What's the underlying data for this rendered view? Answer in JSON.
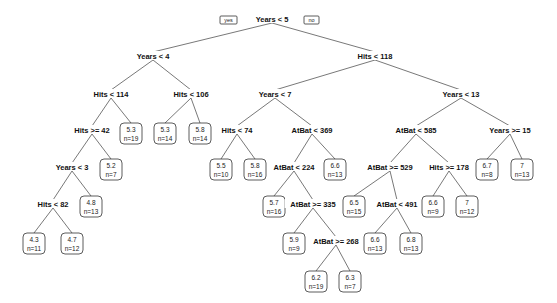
{
  "diagram": {
    "type": "regression-tree",
    "branch_labels": {
      "yes": "yes",
      "no": "no"
    },
    "nodes": [
      {
        "id": "n1",
        "kind": "split",
        "label": "Years < 5",
        "x": 272,
        "y": 20,
        "parent": null
      },
      {
        "id": "n2",
        "kind": "split",
        "label": "Years < 4",
        "x": 153,
        "y": 57,
        "parent": "n1"
      },
      {
        "id": "n3",
        "kind": "split",
        "label": "Hits < 118",
        "x": 375,
        "y": 57,
        "parent": "n1"
      },
      {
        "id": "n4",
        "kind": "split",
        "label": "Hits < 114",
        "x": 111,
        "y": 95,
        "parent": "n2"
      },
      {
        "id": "n5",
        "kind": "split",
        "label": "Hits < 106",
        "x": 191,
        "y": 95,
        "parent": "n2"
      },
      {
        "id": "n8",
        "kind": "split",
        "label": "Hits >= 42",
        "x": 92,
        "y": 131,
        "parent": "n4"
      },
      {
        "id": "n9",
        "kind": "leaf",
        "value": "5.3",
        "n": "n=19",
        "x": 131,
        "y": 133,
        "parent": "n4"
      },
      {
        "id": "n10",
        "kind": "leaf",
        "value": "5.3",
        "n": "n=14",
        "x": 165,
        "y": 133,
        "parent": "n5"
      },
      {
        "id": "n11",
        "kind": "leaf",
        "value": "5.8",
        "n": "n=14",
        "x": 200,
        "y": 133,
        "parent": "n5"
      },
      {
        "id": "n16",
        "kind": "split",
        "label": "Years < 3",
        "x": 72,
        "y": 168,
        "parent": "n8"
      },
      {
        "id": "n17",
        "kind": "leaf",
        "value": "5.2",
        "n": "n=7",
        "x": 111,
        "y": 169,
        "parent": "n8"
      },
      {
        "id": "n32",
        "kind": "split",
        "label": "Hits < 82",
        "x": 53,
        "y": 205,
        "parent": "n16"
      },
      {
        "id": "n33",
        "kind": "leaf",
        "value": "4.8",
        "n": "n=13",
        "x": 91,
        "y": 206,
        "parent": "n16"
      },
      {
        "id": "n64",
        "kind": "leaf",
        "value": "4.3",
        "n": "n=11",
        "x": 34,
        "y": 243,
        "parent": "n32"
      },
      {
        "id": "n65",
        "kind": "leaf",
        "value": "4.7",
        "n": "n=12",
        "x": 72,
        "y": 243,
        "parent": "n32"
      },
      {
        "id": "n6",
        "kind": "split",
        "label": "Years < 7",
        "x": 275,
        "y": 95,
        "parent": "n3"
      },
      {
        "id": "n7",
        "kind": "split",
        "label": "Years < 13",
        "x": 461,
        "y": 95,
        "parent": "n3"
      },
      {
        "id": "n12",
        "kind": "split",
        "label": "Hits < 74",
        "x": 237,
        "y": 131,
        "parent": "n6"
      },
      {
        "id": "n13",
        "kind": "split",
        "label": "AtBat < 369",
        "x": 312,
        "y": 131,
        "parent": "n6"
      },
      {
        "id": "n24",
        "kind": "leaf",
        "value": "5.5",
        "n": "n=10",
        "x": 221,
        "y": 169,
        "parent": "n12"
      },
      {
        "id": "n25",
        "kind": "leaf",
        "value": "5.8",
        "n": "n=16",
        "x": 255,
        "y": 169,
        "parent": "n12"
      },
      {
        "id": "n26",
        "kind": "split",
        "label": "AtBat < 224",
        "x": 294,
        "y": 168,
        "parent": "n13"
      },
      {
        "id": "n27",
        "kind": "leaf",
        "value": "6.6",
        "n": "n=13",
        "x": 335,
        "y": 169,
        "parent": "n13"
      },
      {
        "id": "n52",
        "kind": "leaf",
        "value": "5.7",
        "n": "n=16",
        "x": 274,
        "y": 206,
        "parent": "n26"
      },
      {
        "id": "n53",
        "kind": "split",
        "label": "AtBat >= 335",
        "x": 313,
        "y": 205,
        "parent": "n26"
      },
      {
        "id": "n106",
        "kind": "leaf",
        "value": "5.9",
        "n": "n=9",
        "x": 294,
        "y": 243,
        "parent": "n53"
      },
      {
        "id": "n107",
        "kind": "split",
        "label": "AtBat >= 268",
        "x": 336,
        "y": 242,
        "parent": "n53"
      },
      {
        "id": "n214",
        "kind": "leaf",
        "value": "6.2",
        "n": "n=19",
        "x": 316,
        "y": 281,
        "parent": "n107"
      },
      {
        "id": "n215",
        "kind": "leaf",
        "value": "6.3",
        "n": "n=7",
        "x": 350,
        "y": 281,
        "parent": "n107"
      },
      {
        "id": "n14",
        "kind": "split",
        "label": "AtBat < 585",
        "x": 416,
        "y": 131,
        "parent": "n7"
      },
      {
        "id": "n15",
        "kind": "split",
        "label": "Years >= 15",
        "x": 510,
        "y": 131,
        "parent": "n7"
      },
      {
        "id": "n28",
        "kind": "split",
        "label": "AtBat >= 529",
        "x": 390,
        "y": 168,
        "parent": "n14"
      },
      {
        "id": "n29",
        "kind": "split",
        "label": "Hits >= 178",
        "x": 449,
        "y": 168,
        "parent": "n14"
      },
      {
        "id": "n30",
        "kind": "leaf",
        "value": "6.7",
        "n": "n=8",
        "x": 487,
        "y": 169,
        "parent": "n15"
      },
      {
        "id": "n31",
        "kind": "leaf",
        "value": "7",
        "n": "n=13",
        "x": 522,
        "y": 169,
        "parent": "n15"
      },
      {
        "id": "n56",
        "kind": "leaf",
        "value": "6.5",
        "n": "n=15",
        "x": 354,
        "y": 206,
        "parent": "n28"
      },
      {
        "id": "n57",
        "kind": "split",
        "label": "AtBat < 491",
        "x": 397,
        "y": 205,
        "parent": "n28"
      },
      {
        "id": "n58",
        "kind": "leaf",
        "value": "6.6",
        "n": "n=9",
        "x": 433,
        "y": 206,
        "parent": "n29"
      },
      {
        "id": "n59",
        "kind": "leaf",
        "value": "7",
        "n": "n=12",
        "x": 467,
        "y": 206,
        "parent": "n29"
      },
      {
        "id": "n114",
        "kind": "leaf",
        "value": "6.6",
        "n": "n=13",
        "x": 375,
        "y": 243,
        "parent": "n57"
      },
      {
        "id": "n115",
        "kind": "leaf",
        "value": "6.8",
        "n": "n=13",
        "x": 411,
        "y": 243,
        "parent": "n57"
      }
    ]
  }
}
